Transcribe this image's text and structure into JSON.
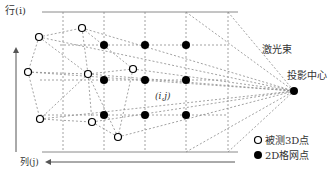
{
  "axes": {
    "row_label": "行(i)",
    "col_label": "列(j)"
  },
  "labels": {
    "cell": "(i,j)",
    "laser_beam": "激光束",
    "projection_center": "投影中心"
  },
  "legend": {
    "items": [
      {
        "symbol": "open-circle",
        "label": "被测3D点"
      },
      {
        "symbol": "filled-circle",
        "label": "2D格网点"
      }
    ]
  },
  "colors": {
    "line": "#8a8a8a",
    "dot": "#000000",
    "text": "#333333"
  }
}
